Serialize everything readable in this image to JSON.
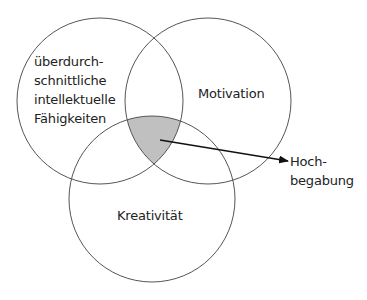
{
  "diagram": {
    "type": "venn",
    "sets": [
      {
        "label_lines": [
          "überdurch-",
          "schnittliche",
          "intellektuelle",
          "Fähigkeiten"
        ],
        "cx": 100,
        "cy": 101,
        "r": 83
      },
      {
        "label_lines": [
          "Motivation"
        ],
        "cx": 208,
        "cy": 101,
        "r": 83
      },
      {
        "label_lines": [
          "Kreativität"
        ],
        "cx": 152,
        "cy": 199,
        "r": 83
      }
    ],
    "intersection": {
      "label_lines": [
        "Hoch-",
        "begabung"
      ],
      "fill": "#c0c0c0"
    },
    "stroke_color": "#555555",
    "text_color": "#222222"
  }
}
